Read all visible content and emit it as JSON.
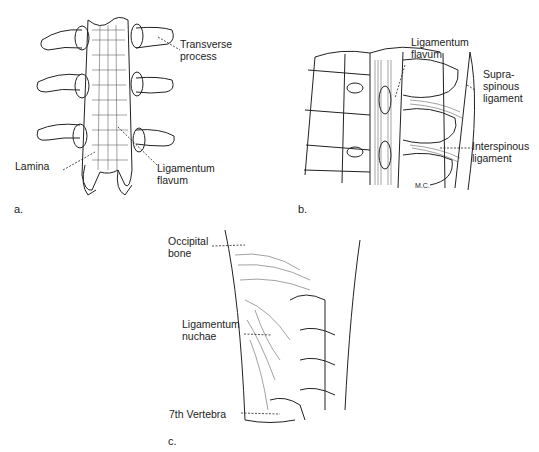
{
  "figure": {
    "panels": [
      {
        "id": "a",
        "caption": "a.",
        "subject": "Posterior view of lumbar vertebrae with ligaments",
        "labels": [
          {
            "text": "Transverse\nprocess"
          },
          {
            "text": "Lamina"
          },
          {
            "text": "Ligamentum\nflavum"
          }
        ]
      },
      {
        "id": "b",
        "caption": "b.",
        "subject": "Sagittal section of spine showing ligaments",
        "labels": [
          {
            "text": "Ligamentum\nflavum"
          },
          {
            "text": "Supra-\nspinous\nligament"
          },
          {
            "text": "Interspinous\nligament"
          }
        ],
        "signature": "M.C."
      },
      {
        "id": "c",
        "caption": "c.",
        "subject": "Lateral view of cervical spine with ligamentum nuchae",
        "labels": [
          {
            "text": "Occipital\nbone"
          },
          {
            "text": "Ligamentum\nnuchae"
          },
          {
            "text": "7th Vertebra"
          }
        ]
      }
    ]
  }
}
